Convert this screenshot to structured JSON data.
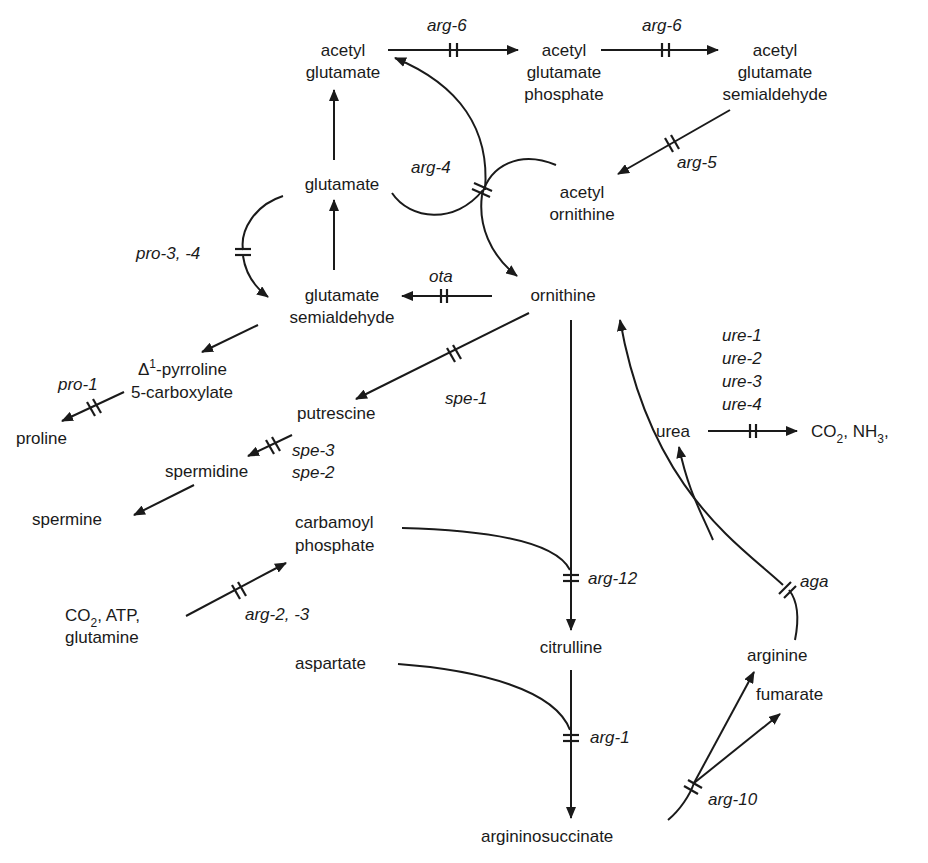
{
  "diagram": {
    "colors": {
      "ink": "#1a1a1a",
      "background": "#ffffff"
    },
    "metabolites": {
      "acetyl_glutamate": [
        "acetyl",
        "glutamate"
      ],
      "acetyl_glutamate_phosphate": [
        "acetyl",
        "glutamate",
        "phosphate"
      ],
      "acetyl_glutamate_semialdehyde": [
        "acetyl",
        "glutamate",
        "semialdehyde"
      ],
      "glutamate": "glutamate",
      "acetyl_ornithine": [
        "acetyl",
        "ornithine"
      ],
      "glutamate_semialdehyde": [
        "glutamate",
        "semialdehyde"
      ],
      "ornithine": "ornithine",
      "pyrroline_carboxylate": {
        "delta": "Δ",
        "sup": "1",
        "line1": "-pyrroline",
        "line2": "5-carboxylate"
      },
      "proline": "proline",
      "putrescine": "putrescine",
      "spermidine": "spermidine",
      "spermine": "spermine",
      "carbamoyl_phosphate": [
        "carbamoyl",
        "phosphate"
      ],
      "co2_atp_glutamine": {
        "co": "CO",
        "sub": "2",
        "rest": ", ATP,",
        "line2": "glutamine"
      },
      "urea": "urea",
      "co2_nh3": {
        "co": "CO",
        "sub1": "2",
        "mid": ", NH",
        "sub2": "3",
        "tail": ","
      },
      "citrulline": "citrulline",
      "aspartate": "aspartate",
      "argininosuccinate": "argininosuccinate",
      "arginine": "arginine",
      "fumarate": "fumarate"
    },
    "genes": {
      "arg6_a": "arg-6",
      "arg6_b": "arg-6",
      "arg5": "arg-5",
      "arg4": "arg-4",
      "pro34": "pro-3, -4",
      "ota": "ota",
      "pro1": "pro-1",
      "spe1": "spe-1",
      "spe3": "spe-3",
      "spe2": "spe-2",
      "ure": [
        "ure-1",
        "ure-2",
        "ure-3",
        "ure-4"
      ],
      "arg23": "arg-2, -3",
      "arg12": "arg-12",
      "aga": "aga",
      "arg1": "arg-1",
      "arg10": "arg-10"
    },
    "reactions": [
      {
        "from": "acetyl glutamate",
        "to": "acetyl glutamate phosphate",
        "gene": "arg-6"
      },
      {
        "from": "acetyl glutamate phosphate",
        "to": "acetyl glutamate semialdehyde",
        "gene": "arg-6"
      },
      {
        "from": "acetyl glutamate semialdehyde",
        "to": "acetyl ornithine",
        "gene": "arg-5"
      },
      {
        "from": "acetyl ornithine + glutamate",
        "to": "ornithine + acetyl glutamate",
        "gene": "arg-4"
      },
      {
        "from": "glutamate",
        "to": "acetyl glutamate",
        "gene": ""
      },
      {
        "from": "glutamate semialdehyde",
        "to": "glutamate",
        "gene": ""
      },
      {
        "from": "glutamate",
        "to": "glutamate semialdehyde",
        "gene": "pro-3, -4"
      },
      {
        "from": "ornithine",
        "to": "glutamate semialdehyde",
        "gene": "ota"
      },
      {
        "from": "glutamate semialdehyde",
        "to": "Δ1-pyrroline 5-carboxylate",
        "gene": ""
      },
      {
        "from": "Δ1-pyrroline 5-carboxylate",
        "to": "proline",
        "gene": "pro-1"
      },
      {
        "from": "ornithine",
        "to": "putrescine",
        "gene": "spe-1"
      },
      {
        "from": "putrescine",
        "to": "spermidine",
        "gene": "spe-3, spe-2"
      },
      {
        "from": "spermidine",
        "to": "spermine",
        "gene": ""
      },
      {
        "from": "CO2, ATP, glutamine",
        "to": "carbamoyl phosphate",
        "gene": "arg-2, -3"
      },
      {
        "from": "ornithine + carbamoyl phosphate",
        "to": "citrulline",
        "gene": "arg-12"
      },
      {
        "from": "citrulline + aspartate",
        "to": "argininosuccinate",
        "gene": "arg-1"
      },
      {
        "from": "argininosuccinate",
        "to": "arginine + fumarate",
        "gene": "arg-10"
      },
      {
        "from": "arginine",
        "to": "ornithine + urea",
        "gene": "aga"
      },
      {
        "from": "urea",
        "to": "CO2, NH3",
        "gene": "ure-1, ure-2, ure-3, ure-4"
      }
    ]
  }
}
